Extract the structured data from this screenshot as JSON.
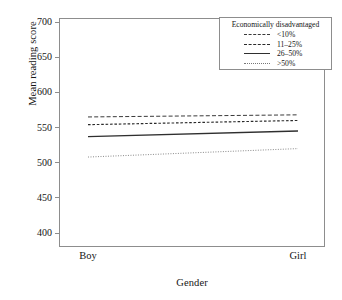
{
  "chart_data": {
    "type": "line",
    "title": "",
    "xlabel": "Gender",
    "ylabel": "Mean reading score",
    "categories": [
      "Boy",
      "Girl"
    ],
    "x": [
      0,
      1
    ],
    "ylim": [
      400,
      700
    ],
    "yticks": [
      400,
      450,
      500,
      550,
      600,
      650,
      700
    ],
    "ytick_labels": [
      "400",
      "450",
      "500",
      "550",
      "600",
      "650",
      "700"
    ],
    "grid": false,
    "legend_position": "top-right",
    "legend_title": "Economically disadvantaged",
    "series": [
      {
        "name": "<10%",
        "values": [
          565,
          568
        ],
        "style": "long-dash",
        "color": "#3a3a3a"
      },
      {
        "name": "11-25%",
        "values": [
          554,
          560
        ],
        "style": "dash",
        "color": "#2a2a2a"
      },
      {
        "name": "26-50%",
        "values": [
          537,
          545
        ],
        "style": "solid",
        "color": "#2f2f2f"
      },
      {
        "name": ">50%",
        "values": [
          508,
          520
        ],
        "style": "dotted",
        "color": "#777777"
      }
    ]
  },
  "axes": {
    "y_title": "Mean reading score",
    "x_title": "Gender",
    "y_ticks": [
      {
        "label": "700"
      },
      {
        "label": "650"
      },
      {
        "label": "600"
      },
      {
        "label": "550"
      },
      {
        "label": "500"
      },
      {
        "label": "450"
      },
      {
        "label": "400"
      }
    ],
    "x_ticks": [
      {
        "label": "Boy"
      },
      {
        "label": "Girl"
      }
    ]
  },
  "legend": {
    "title": "Economically disadvantaged",
    "items": [
      {
        "label": "<10%"
      },
      {
        "label": "11–25%"
      },
      {
        "label": "26–50%"
      },
      {
        "label": ">50%"
      }
    ]
  }
}
